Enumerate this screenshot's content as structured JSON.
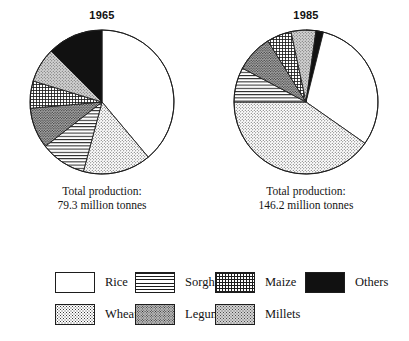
{
  "figure": {
    "kind": "two-pie-comparison",
    "panels": [
      {
        "id": "panel-1965",
        "title": "1965",
        "total_line1": "Total production:",
        "total_line2": "79.3 million tonnes"
      },
      {
        "id": "panel-1985",
        "title": "1985",
        "total_line1": "Total production:",
        "total_line2": "146.2 million tonnes"
      }
    ]
  },
  "legend": {
    "rows": [
      [
        {
          "key": "rice",
          "label": "Rice",
          "pattern": "white"
        },
        {
          "key": "sorghum",
          "label": "Sorghum",
          "pattern": "horizontal-lines"
        },
        {
          "key": "maize",
          "label": "Maize",
          "pattern": "cross-hatch-grid"
        },
        {
          "key": "others",
          "label": "Others",
          "pattern": "solid-black"
        }
      ],
      [
        {
          "key": "wheat",
          "label": "Wheat",
          "pattern": "light-dots"
        },
        {
          "key": "legumes",
          "label": "Legumes",
          "pattern": "dark-gray-dots"
        },
        {
          "key": "millets",
          "label": "Millets",
          "pattern": "gray-dots"
        }
      ]
    ]
  },
  "colors": {
    "ink": "#1a1a1a",
    "outline": "#1d1d1d",
    "background": "#ffffff",
    "others_black": "#111111",
    "legumes_gray": "#b9b9b9",
    "millets_gray": "#d3d3d3"
  },
  "chart_data": [
    {
      "type": "pie",
      "title": "1965",
      "unit": "million tonnes",
      "total": 79.3,
      "total_label": "Total production: 79.3 million tonnes",
      "start_angle_deg": 0,
      "direction": "clockwise",
      "legend_position": "bottom",
      "categories": [
        "Rice",
        "Wheat",
        "Sorghum",
        "Legumes",
        "Maize",
        "Millets",
        "Others"
      ],
      "values": [
        38.9,
        15.3,
        10.3,
        9.2,
        6.1,
        7.8,
        12.4
      ],
      "angles_deg": [
        140,
        55,
        37,
        33,
        22,
        28,
        45
      ],
      "patterns": [
        "white",
        "light-dots",
        "horizontal-lines",
        "dark-gray-dots",
        "cross-hatch-grid",
        "gray-dots",
        "solid-black"
      ]
    },
    {
      "type": "pie",
      "title": "1985",
      "unit": "million tonnes",
      "total": 146.2,
      "total_label": "Total production: 146.2 million tonnes",
      "start_angle_deg": 0,
      "direction": "clockwise",
      "legend_position": "bottom",
      "categories": [
        "Rice",
        "Wheat",
        "Sorghum",
        "Legumes",
        "Maize",
        "Millets",
        "Others"
      ],
      "values": [
        50.8,
        58.9,
        11.4,
        12.2,
        8.1,
        8.1,
        2.4
      ],
      "angles_deg": [
        125,
        145,
        28,
        30,
        20,
        20,
        6
      ],
      "patterns": [
        "white",
        "light-dots",
        "horizontal-lines",
        "dark-gray-dots",
        "cross-hatch-grid",
        "gray-dots",
        "solid-black"
      ]
    }
  ]
}
